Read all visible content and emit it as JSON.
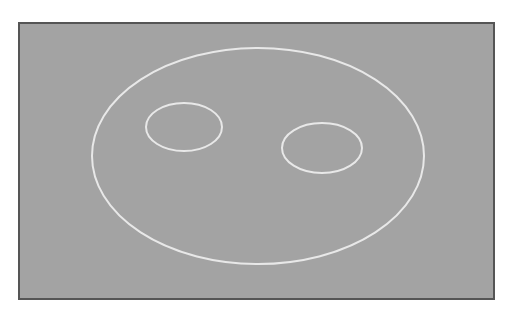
{
  "colors": {
    "background": "#ffffff",
    "canvas": "#a3a3a3",
    "frame_border": "#555555",
    "stroke": "#e8e8e8"
  },
  "shapes": {
    "face": {
      "cx": 258,
      "cy": 156,
      "rx": 166,
      "ry": 108
    },
    "left_eye": {
      "cx": 184,
      "cy": 127,
      "rx": 38,
      "ry": 24
    },
    "right_eye": {
      "cx": 322,
      "cy": 148,
      "rx": 40,
      "ry": 25
    }
  }
}
